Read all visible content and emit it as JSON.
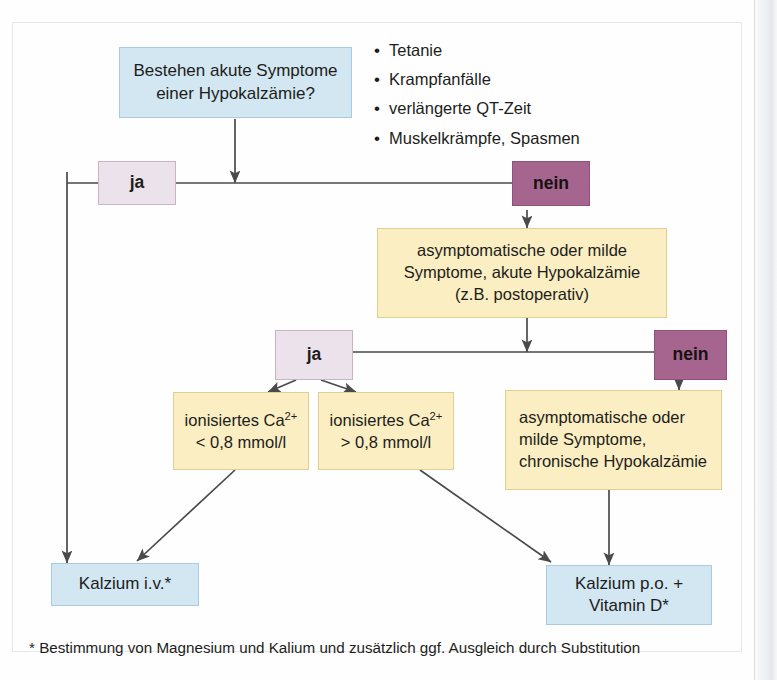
{
  "colors": {
    "blue_fill": "#d3e7f2",
    "blue_border": "#a8cbe0",
    "yellow_fill": "#faeec2",
    "yellow_border": "#e0cf8e",
    "ja_fill": "#ece2ec",
    "ja_border": "#c9b4c6",
    "nein_fill": "#a5658f",
    "nein_border": "#8e5279",
    "connector": "#4a4a4a",
    "text": "#1d1d1b"
  },
  "nodes": {
    "question": {
      "line1": "Bestehen akute Symptome",
      "line2": "einer Hypokalzämie?"
    },
    "decision1_yes": "ja",
    "decision1_no": "nein",
    "acute": {
      "line1": "asymptomatische oder milde",
      "line2": "Symptome, akute Hypokalzämie",
      "line3": "(z.B. postoperativ)"
    },
    "decision2_yes": "ja",
    "decision2_no": "nein",
    "ca_low": {
      "line1_pre": "ionisiertes Ca",
      "line1_sup": "2+",
      "line2": "< 0,8 mmol/l"
    },
    "ca_high": {
      "line1_pre": "ionisiertes Ca",
      "line1_sup": "2+",
      "line2": "> 0,8 mmol/l"
    },
    "chronic": {
      "line1": "asymptomatische oder",
      "line2": "milde Symptome,",
      "line3": "chronische Hypokalzämie"
    },
    "treatment_iv": "Kalzium i.v.*",
    "treatment_po": {
      "line1": "Kalzium p.o. +",
      "line2": "Vitamin D*"
    }
  },
  "symptoms": {
    "bullet_char": "•",
    "items": [
      "Tetanie",
      "Krampfanfälle",
      "verlängerte QT-Zeit",
      "Muskelkrämpfe, Spasmen"
    ]
  },
  "footnote": "* Bestimmung von Magnesium und Kalium und zusätzlich ggf. Ausgleich durch Substitution"
}
